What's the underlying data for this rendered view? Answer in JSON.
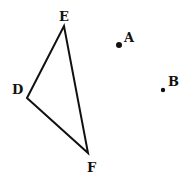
{
  "diagram": {
    "triangle": {
      "name": "DEF",
      "vertices": {
        "D": {
          "label": "D",
          "x": 27,
          "y": 98
        },
        "E": {
          "label": "E",
          "x": 64,
          "y": 26
        },
        "F": {
          "label": "F",
          "x": 88,
          "y": 153
        }
      }
    },
    "points": {
      "A": {
        "label": "A",
        "x": 119,
        "y": 45
      },
      "B": {
        "label": "B",
        "x": 163,
        "y": 90
      }
    },
    "stroke_color": "#111111"
  }
}
